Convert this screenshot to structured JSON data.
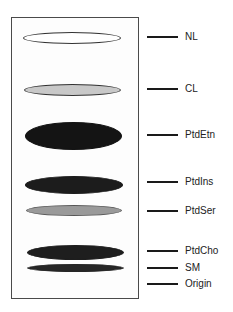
{
  "figure": {
    "type": "thin-layer chromatography plate schematic",
    "plate": {
      "border_color": "#4a4a4a",
      "background": "#fdfdfd"
    },
    "spots": [
      {
        "id": "NL",
        "fill": "#ffffff",
        "stroke": "#333333",
        "cx": 72,
        "cy": 38,
        "w": 98,
        "h": 12
      },
      {
        "id": "CL",
        "fill": "#c8c8c8",
        "stroke": "#333333",
        "cx": 72,
        "cy": 90,
        "w": 97,
        "h": 12
      },
      {
        "id": "PtdEtn",
        "fill": "#141414",
        "stroke": "#141414",
        "cx": 73,
        "cy": 136,
        "w": 97,
        "h": 28
      },
      {
        "id": "PtdIns",
        "fill": "#1c1c1c",
        "stroke": "#1c1c1c",
        "cx": 74,
        "cy": 185,
        "w": 98,
        "h": 18
      },
      {
        "id": "PtdSer",
        "fill": "#9a9a9a",
        "stroke": "#555555",
        "cx": 74,
        "cy": 210,
        "w": 96,
        "h": 11
      },
      {
        "id": "PtdCho",
        "fill": "#1e1e1e",
        "stroke": "#1e1e1e",
        "cx": 75,
        "cy": 252,
        "w": 97,
        "h": 15
      },
      {
        "id": "SM",
        "fill": "#262626",
        "stroke": "#262626",
        "cx": 75,
        "cy": 268,
        "w": 97,
        "h": 8
      }
    ],
    "labels": [
      {
        "text": "NL",
        "y": 37
      },
      {
        "text": "CL",
        "y": 89
      },
      {
        "text": "PtdEtn",
        "y": 135
      },
      {
        "text": "PtdIns",
        "y": 182
      },
      {
        "text": "PtdSer",
        "y": 211
      },
      {
        "text": "PtdCho",
        "y": 251
      },
      {
        "text": "SM",
        "y": 268
      },
      {
        "text": "Origin",
        "y": 284
      }
    ]
  }
}
